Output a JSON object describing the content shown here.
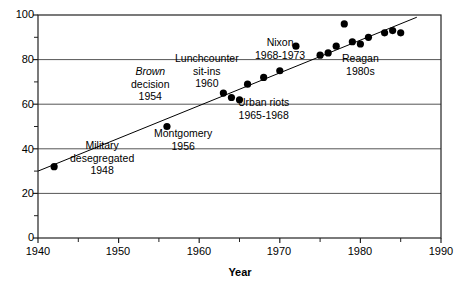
{
  "chart_data": {
    "type": "scatter",
    "title": "",
    "subtitle": "",
    "xlabel": "Year",
    "ylabel": "",
    "xlim": [
      1940,
      1990
    ],
    "ylim": [
      0,
      100
    ],
    "grid": true,
    "grid_axis": "y",
    "legend": false,
    "xticks": [
      1940,
      1950,
      1960,
      1970,
      1980,
      1990
    ],
    "xticklabels": [
      "1940",
      "1950",
      "1960",
      "1970",
      "1980",
      "1990"
    ],
    "xminorticks": [
      1945,
      1955,
      1965,
      1975,
      1985
    ],
    "yticks": [
      0,
      20,
      40,
      60,
      80,
      100
    ],
    "yticklabels": [
      "0",
      "20",
      "40",
      "60",
      "80",
      "100"
    ],
    "yminorticks": [
      10,
      30,
      50,
      70,
      90
    ],
    "marker": "circle-filled",
    "marker_color": "#000000",
    "marker_size": 6,
    "points": [
      {
        "x": 1942,
        "y": 32
      },
      {
        "x": 1956,
        "y": 50
      },
      {
        "x": 1963,
        "y": 65
      },
      {
        "x": 1964,
        "y": 63
      },
      {
        "x": 1965,
        "y": 62
      },
      {
        "x": 1966,
        "y": 69
      },
      {
        "x": 1968,
        "y": 72
      },
      {
        "x": 1970,
        "y": 75
      },
      {
        "x": 1972,
        "y": 86
      },
      {
        "x": 1975,
        "y": 82
      },
      {
        "x": 1976,
        "y": 83
      },
      {
        "x": 1977,
        "y": 86
      },
      {
        "x": 1978,
        "y": 96
      },
      {
        "x": 1979,
        "y": 88
      },
      {
        "x": 1980,
        "y": 87
      },
      {
        "x": 1981,
        "y": 90
      },
      {
        "x": 1983,
        "y": 92
      },
      {
        "x": 1984,
        "y": 93
      },
      {
        "x": 1985,
        "y": 92
      }
    ],
    "trendline": {
      "type": "linear",
      "x": [
        1940,
        1987
      ],
      "y": [
        30,
        99
      ],
      "color": "#000000"
    },
    "annotations": [
      {
        "name": "military-desegregated",
        "lines": [
          "Military",
          "desegregated",
          "1948"
        ],
        "italic_lines": [],
        "x": 1948,
        "y": 36
      },
      {
        "name": "brown-decision",
        "lines": [
          "Brown",
          "decision",
          "1954"
        ],
        "italic_lines": [
          "Brown"
        ],
        "x": 1954,
        "y": 69
      },
      {
        "name": "montgomery",
        "lines": [
          "Montgomery",
          "1956"
        ],
        "italic_lines": [],
        "x": 1958,
        "y": 44
      },
      {
        "name": "lunchcounter-sit-ins",
        "lines": [
          "Lunchcounter",
          "sit-ins",
          "1960"
        ],
        "italic_lines": [],
        "x": 1961,
        "y": 75
      },
      {
        "name": "urban-riots",
        "lines": [
          "Urban riots",
          "1965-1968"
        ],
        "italic_lines": [],
        "x": 1968,
        "y": 58
      },
      {
        "name": "nixon",
        "lines": [
          "Nixon",
          "1968-1973"
        ],
        "italic_lines": [],
        "x": 1970,
        "y": 85
      },
      {
        "name": "reagan",
        "lines": [
          "Reagan",
          "1980s"
        ],
        "italic_lines": [],
        "x": 1980,
        "y": 78
      }
    ]
  },
  "axis": {
    "x_title": "Year",
    "y_title": ""
  },
  "colors": {
    "frame": "#222222",
    "gridline": "#555555",
    "marker": "#000000",
    "background": "#ffffff"
  }
}
